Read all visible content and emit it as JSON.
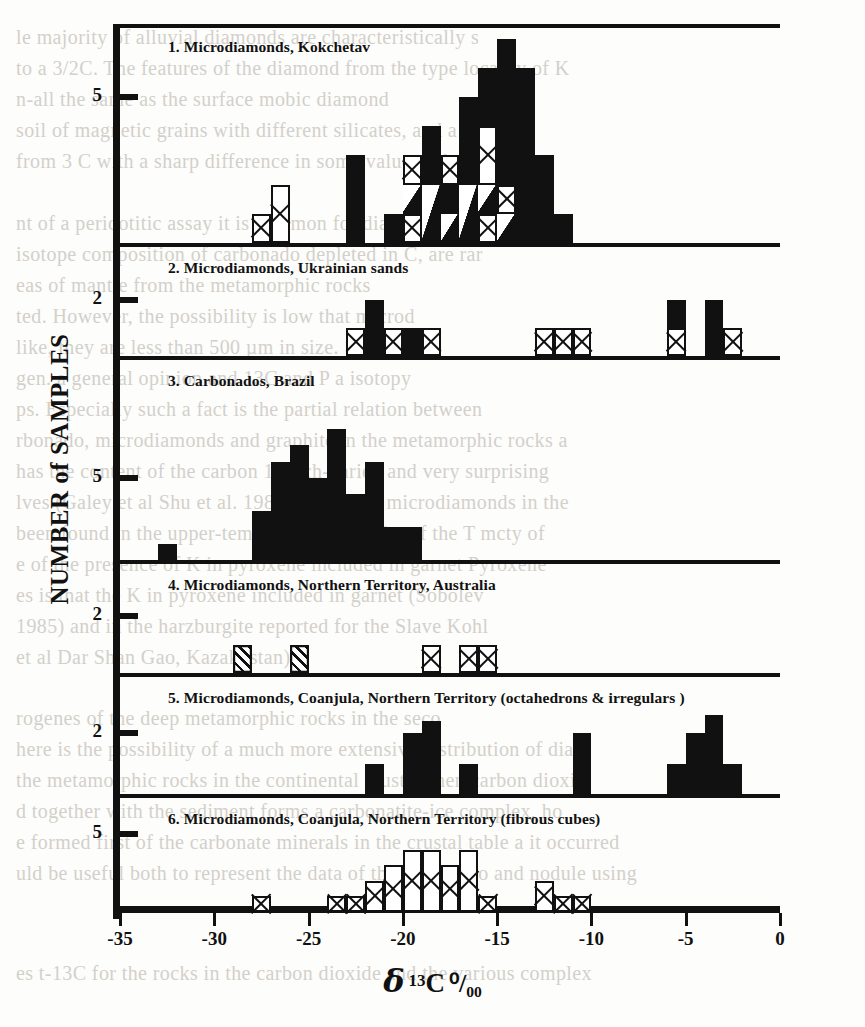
{
  "figure": {
    "xaxis_title_parts": {
      "delta": "δ",
      "sup": "13",
      "element": "C",
      "permil": "⁰/₀₀"
    },
    "yaxis_title": "NUMBER of SAMPLES",
    "x_ticks": [
      "-35",
      "-30",
      "-25",
      "-20",
      "-15",
      "-10",
      "-5",
      "0"
    ],
    "x_tick_values": [
      -35,
      -30,
      -25,
      -20,
      -15,
      -10,
      -5,
      0
    ]
  },
  "ghost_text": [
    {
      "x": 16,
      "y": 26,
      "t": "le majority of alluvial diamonds are characteristically s"
    },
    {
      "x": 16,
      "y": 57,
      "t": "to a 3/2C. The features of the diamond  from the type locality of K"
    },
    {
      "x": 16,
      "y": 88,
      "t": "n-all the same as the surface mobic  diamond"
    },
    {
      "x": 16,
      "y": 119,
      "t": "soil of magnetic grains with different silicates, and a few"
    },
    {
      "x": 16,
      "y": 150,
      "t": "from 3 C  with a sharp difference in some value with kno"
    },
    {
      "x": 16,
      "y": 212,
      "t": "nt of a peridotitic assay it is common for diamonds of the"
    },
    {
      "x": 16,
      "y": 243,
      "t": "isotope composition of carbonado depleted in C, are rar"
    },
    {
      "x": 16,
      "y": 274,
      "t": "eas of  mantle from the metamorphic rocks"
    },
    {
      "x": 16,
      "y": 305,
      "t": "ted. However, the possibility is low that  microd"
    },
    {
      "x": 16,
      "y": 336,
      "t": "like, they are less than 500 µm in size. Sev   relat"
    },
    {
      "x": 16,
      "y": 367,
      "t": "gen. a general opinion and 13C and P a  isotopy"
    },
    {
      "x": 16,
      "y": 398,
      "t": "ps. Especially such a fact is the partial relation between"
    },
    {
      "x": 16,
      "y": 429,
      "t": "rbonado, microdiamonds and graphite in the metamorphic rocks a"
    },
    {
      "x": 16,
      "y": 460,
      "t": "has the content of the carbon 14 rich-varied and very surprising"
    },
    {
      "x": 16,
      "y": 491,
      "t": "lves (Galey et al Shu et al. 1987) Pb, S-rich  microdiamonds in the"
    },
    {
      "x": 16,
      "y": 522,
      "t": "been found in the  upper-temperature ecologite of the T  mcty of"
    },
    {
      "x": 16,
      "y": 553,
      "t": "e of the presence of K in pyroxene included in garnet  Pyroxene"
    },
    {
      "x": 16,
      "y": 584,
      "t": "es is that the K in pyroxene included in garnet  (Sobolev"
    },
    {
      "x": 16,
      "y": 615,
      "t": "1985) and in the harzburgite reported for the Slave  Kohl"
    },
    {
      "x": 16,
      "y": 646,
      "t": "et al Dar Shan Gao, Kazakhstan)"
    },
    {
      "x": 16,
      "y": 707,
      "t": "rogenes of the deep metamorphic rocks in the  seco"
    },
    {
      "x": 16,
      "y": 738,
      "t": "here is the possibility of a much more extensive distribution of diam"
    },
    {
      "x": 16,
      "y": 769,
      "t": "the metamorphic rocks in the continental crust. When carbon dioxid"
    },
    {
      "x": 16,
      "y": 800,
      "t": "d together with the sediment forms a  carbonatite-ice complex, ho"
    },
    {
      "x": 16,
      "y": 831,
      "t": "e formed first of the carbonate minerals in the crustal table  a it occurred"
    },
    {
      "x": 16,
      "y": 862,
      "t": "uld be useful both to represent the data of the carbonado and nodule using"
    },
    {
      "x": 16,
      "y": 962,
      "t": "es t-13C for the rocks in the carbon dioxide and the various complex"
    }
  ],
  "chart_data": {
    "type": "bar",
    "title": "",
    "xlabel": "δ 13C ⁰/₀₀",
    "ylabel": "NUMBER of SAMPLES",
    "xlim": [
      -35,
      0
    ],
    "bin_width": 1,
    "grid": false,
    "legend": [],
    "fill_legend": {
      "solid": "solid black fill",
      "cross": "X-crossed (mesh) fill",
      "hatch": "diagonal hatch fill",
      "tri": "solid with white corner triangle"
    },
    "panels": [
      {
        "index": 1,
        "label": "1. Microdiamonds, Kokchetav",
        "ylim": [
          0,
          7
        ],
        "y_ticks": [
          5
        ],
        "y_tick_labels": [
          "5"
        ],
        "bars": [
          {
            "x": -28,
            "segments": [
              {
                "fill": "cross",
                "value": 1
              }
            ]
          },
          {
            "x": -27,
            "segments": [
              {
                "fill": "cross",
                "value": 2
              }
            ]
          },
          {
            "x": -23,
            "segments": [
              {
                "fill": "solid",
                "value": 3
              }
            ]
          },
          {
            "x": -21,
            "segments": [
              {
                "fill": "solid",
                "value": 1
              }
            ]
          },
          {
            "x": -20,
            "segments": [
              {
                "fill": "cross",
                "value": 1
              },
              {
                "fill": "tri",
                "value": 1
              },
              {
                "fill": "cross",
                "value": 1
              }
            ]
          },
          {
            "x": -19,
            "segments": [
              {
                "fill": "tri",
                "value": 2
              },
              {
                "fill": "solid",
                "value": 2
              }
            ]
          },
          {
            "x": -18,
            "segments": [
              {
                "fill": "tri",
                "value": 1
              },
              {
                "fill": "solid",
                "value": 1
              },
              {
                "fill": "cross",
                "value": 1
              }
            ]
          },
          {
            "x": -17,
            "segments": [
              {
                "fill": "tri",
                "value": 2
              },
              {
                "fill": "solid",
                "value": 3
              }
            ]
          },
          {
            "x": -16,
            "segments": [
              {
                "fill": "cross",
                "value": 1
              },
              {
                "fill": "tri",
                "value": 1
              },
              {
                "fill": "cross",
                "value": 2
              },
              {
                "fill": "solid",
                "value": 2
              }
            ]
          },
          {
            "x": -15,
            "segments": [
              {
                "fill": "tri",
                "value": 1
              },
              {
                "fill": "cross",
                "value": 1
              },
              {
                "fill": "solid",
                "value": 5
              }
            ]
          },
          {
            "x": -14,
            "segments": [
              {
                "fill": "solid",
                "value": 6
              }
            ]
          },
          {
            "x": -13,
            "segments": [
              {
                "fill": "solid",
                "value": 3
              }
            ]
          },
          {
            "x": -12,
            "segments": [
              {
                "fill": "solid",
                "value": 1
              }
            ]
          }
        ]
      },
      {
        "index": 2,
        "label": "2. Microdiamonds, Ukrainian sands",
        "ylim": [
          0,
          3
        ],
        "y_ticks": [
          2
        ],
        "y_tick_labels": [
          "2"
        ],
        "bars": [
          {
            "x": -23,
            "segments": [
              {
                "fill": "cross",
                "value": 1
              }
            ]
          },
          {
            "x": -22,
            "segments": [
              {
                "fill": "solid",
                "value": 2
              }
            ]
          },
          {
            "x": -21,
            "segments": [
              {
                "fill": "cross",
                "value": 1
              }
            ]
          },
          {
            "x": -20,
            "segments": [
              {
                "fill": "solid",
                "value": 1
              }
            ]
          },
          {
            "x": -19,
            "segments": [
              {
                "fill": "cross",
                "value": 1
              }
            ]
          },
          {
            "x": -13,
            "segments": [
              {
                "fill": "cross",
                "value": 1
              }
            ]
          },
          {
            "x": -12,
            "segments": [
              {
                "fill": "cross",
                "value": 1
              }
            ]
          },
          {
            "x": -11,
            "segments": [
              {
                "fill": "cross",
                "value": 1
              }
            ]
          },
          {
            "x": -6,
            "segments": [
              {
                "fill": "cross",
                "value": 1
              },
              {
                "fill": "solid",
                "value": 1
              }
            ]
          },
          {
            "x": -4,
            "segments": [
              {
                "fill": "solid",
                "value": 2
              }
            ]
          },
          {
            "x": -3,
            "segments": [
              {
                "fill": "cross",
                "value": 1
              }
            ]
          }
        ]
      },
      {
        "index": 3,
        "label": "3. Carbonados, Brazil",
        "ylim": [
          0,
          9
        ],
        "y_ticks": [
          5
        ],
        "y_tick_labels": [
          "5"
        ],
        "bars": [
          {
            "x": -33,
            "segments": [
              {
                "fill": "solid",
                "value": 1
              }
            ]
          },
          {
            "x": -28,
            "segments": [
              {
                "fill": "solid",
                "value": 3
              }
            ]
          },
          {
            "x": -27,
            "segments": [
              {
                "fill": "solid",
                "value": 6
              }
            ]
          },
          {
            "x": -26,
            "segments": [
              {
                "fill": "solid",
                "value": 7
              }
            ]
          },
          {
            "x": -25,
            "segments": [
              {
                "fill": "solid",
                "value": 5
              }
            ]
          },
          {
            "x": -24,
            "segments": [
              {
                "fill": "solid",
                "value": 8
              }
            ]
          },
          {
            "x": -23,
            "segments": [
              {
                "fill": "solid",
                "value": 4
              }
            ]
          },
          {
            "x": -22,
            "segments": [
              {
                "fill": "solid",
                "value": 6
              }
            ]
          },
          {
            "x": -21,
            "segments": [
              {
                "fill": "solid",
                "value": 2
              }
            ]
          },
          {
            "x": -20,
            "segments": [
              {
                "fill": "solid",
                "value": 2
              }
            ]
          }
        ]
      },
      {
        "index": 4,
        "label": "4. Microdiamonds, Northern Territory, Australia",
        "ylim": [
          0,
          3
        ],
        "y_ticks": [
          2
        ],
        "y_tick_labels": [
          "2"
        ],
        "bars": [
          {
            "x": -29,
            "segments": [
              {
                "fill": "hatch",
                "value": 1
              }
            ]
          },
          {
            "x": -26,
            "segments": [
              {
                "fill": "hatch",
                "value": 1
              }
            ]
          },
          {
            "x": -19,
            "segments": [
              {
                "fill": "cross",
                "value": 1
              }
            ]
          },
          {
            "x": -17,
            "segments": [
              {
                "fill": "cross",
                "value": 1
              }
            ]
          },
          {
            "x": -16,
            "segments": [
              {
                "fill": "cross",
                "value": 1
              }
            ]
          }
        ]
      },
      {
        "index": 5,
        "label": "5. Microdiamonds, Coanjula, Northern Territory (octahedrons & irregulars )",
        "ylim": [
          0,
          3
        ],
        "y_ticks": [
          2
        ],
        "y_tick_labels": [
          "2"
        ],
        "bars": [
          {
            "x": -22,
            "segments": [
              {
                "fill": "solid",
                "value": 1
              }
            ]
          },
          {
            "x": -20,
            "segments": [
              {
                "fill": "solid",
                "value": 2
              }
            ]
          },
          {
            "x": -19,
            "segments": [
              {
                "fill": "solid",
                "value": 2.4
              }
            ]
          },
          {
            "x": -17,
            "segments": [
              {
                "fill": "solid",
                "value": 1
              }
            ]
          },
          {
            "x": -11,
            "segments": [
              {
                "fill": "solid",
                "value": 2
              }
            ]
          },
          {
            "x": -6,
            "segments": [
              {
                "fill": "solid",
                "value": 1
              }
            ]
          },
          {
            "x": -5,
            "segments": [
              {
                "fill": "solid",
                "value": 2
              }
            ]
          },
          {
            "x": -4,
            "segments": [
              {
                "fill": "solid",
                "value": 2.6
              }
            ]
          },
          {
            "x": -3,
            "segments": [
              {
                "fill": "solid",
                "value": 1
              }
            ]
          }
        ]
      },
      {
        "index": 6,
        "label": "6. Microdiamonds, Coanjula, Northern Territory (fibrous cubes)",
        "ylim": [
          0,
          6
        ],
        "y_ticks": [
          5
        ],
        "y_tick_labels": [
          "5"
        ],
        "bars": [
          {
            "x": -28,
            "segments": [
              {
                "fill": "cross",
                "value": 1
              }
            ]
          },
          {
            "x": -24,
            "segments": [
              {
                "fill": "cross",
                "value": 1
              }
            ]
          },
          {
            "x": -23,
            "segments": [
              {
                "fill": "cross",
                "value": 1
              }
            ]
          },
          {
            "x": -22,
            "segments": [
              {
                "fill": "cross",
                "value": 2
              }
            ]
          },
          {
            "x": -21,
            "segments": [
              {
                "fill": "cross",
                "value": 3
              }
            ]
          },
          {
            "x": -20,
            "segments": [
              {
                "fill": "cross",
                "value": 4
              }
            ]
          },
          {
            "x": -19,
            "segments": [
              {
                "fill": "cross",
                "value": 4
              }
            ]
          },
          {
            "x": -18,
            "segments": [
              {
                "fill": "cross",
                "value": 3
              }
            ]
          },
          {
            "x": -17,
            "segments": [
              {
                "fill": "cross",
                "value": 4
              }
            ]
          },
          {
            "x": -16,
            "segments": [
              {
                "fill": "cross",
                "value": 1
              }
            ]
          },
          {
            "x": -13,
            "segments": [
              {
                "fill": "cross",
                "value": 2
              }
            ]
          },
          {
            "x": -12,
            "segments": [
              {
                "fill": "cross",
                "value": 1
              }
            ]
          },
          {
            "x": -11,
            "segments": [
              {
                "fill": "cross",
                "value": 1
              }
            ]
          }
        ]
      }
    ]
  }
}
